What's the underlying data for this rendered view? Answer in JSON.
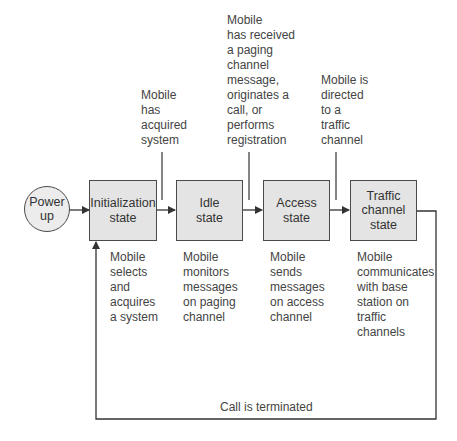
{
  "diagram": {
    "start_node": {
      "label": "Power\nup"
    },
    "states": [
      {
        "id": "initialization",
        "label": "Initialization\nstate",
        "description": "Mobile\nselects\nand\nacquires\na system"
      },
      {
        "id": "idle",
        "label": "Idle\nstate",
        "description": "Mobile\nmonitors\nmessages\non paging\nchannel"
      },
      {
        "id": "access",
        "label": "Access\nstate",
        "description": "Mobile\nsends\nmessages\non access\nchannel"
      },
      {
        "id": "traffic",
        "label": "Traffic\nchannel\nstate",
        "description": "Mobile\ncommunicates\nwith base\nstation on\ntraffic\nchannels"
      }
    ],
    "transitions": [
      {
        "from": "initialization",
        "to": "idle",
        "condition": "Mobile\nhas\nacquired\nsystem"
      },
      {
        "from": "idle",
        "to": "access",
        "condition": "Mobile\nhas received\na paging\nchannel\nmessage,\noriginates a\ncall, or\nperforms\nregistration"
      },
      {
        "from": "access",
        "to": "traffic",
        "condition": "Mobile is\ndirected\nto a\ntraffic\nchannel"
      },
      {
        "from": "traffic",
        "to": "initialization",
        "condition": "Call is terminated"
      }
    ],
    "colors": {
      "box_fill": "#e4e4e4",
      "stroke": "#4a4a4a",
      "text": "#333333"
    }
  }
}
